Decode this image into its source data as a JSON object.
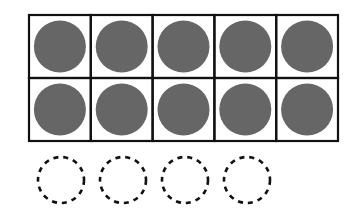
{
  "diagram": {
    "type": "ten-frame",
    "rows": 2,
    "columns": 5,
    "filled_counters": 10,
    "empty_dashed_circles": 4,
    "colors": {
      "counter_fill": "#666666",
      "grid_stroke": "#111111",
      "dashed_stroke": "#111111",
      "background": "#ffffff"
    }
  }
}
